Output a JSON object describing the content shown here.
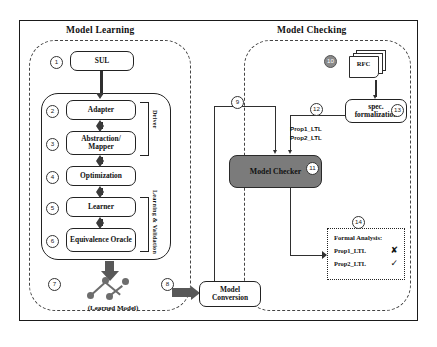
{
  "diagram": {
    "panels": {
      "learning_title": "Model Learning",
      "checking_title": "Model Checking"
    },
    "side_labels": {
      "driver": "Driver",
      "learning_validation": "Learning & Validation"
    },
    "nodes": {
      "sul": "SUL",
      "adapter": "Adapter",
      "abstraction": "Abstraction/ Mapper",
      "optimization": "Optimization",
      "learner": "Learner",
      "oracle": "Equivalence Oracle",
      "learned_model": "(Learned Model)",
      "model_conversion": "Model Conversion",
      "model_checker": "Model Checker",
      "spec_formalization": "spec. formalization",
      "rfc": "RFC"
    },
    "ltl_labels": {
      "prop1": "Prop1_LTL",
      "prop2": "Prop2_LTL"
    },
    "formal_analysis": {
      "title": "Formal Analysis:",
      "rows": [
        {
          "label": "Prop1_LTL",
          "mark": "✘"
        },
        {
          "label": "Prop2_LTL",
          "mark": "✓"
        }
      ]
    },
    "step_numbers": {
      "n1": "1",
      "n2": "2",
      "n3": "3",
      "n4": "4",
      "n5": "5",
      "n6": "6",
      "n7": "7",
      "n8": "8",
      "n9": "9",
      "n10": "10",
      "n11": "11",
      "n12": "12",
      "n13": "13",
      "n14": "14"
    },
    "colors": {
      "checker_fill": "#7b7b7b",
      "arrow": "#585858",
      "line": "#2f2f2f",
      "border": "#1a1a1a"
    }
  }
}
